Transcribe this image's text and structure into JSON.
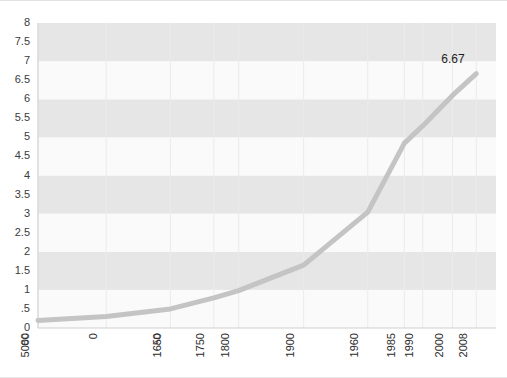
{
  "chart_data": {
    "type": "line",
    "title": "",
    "subtitle": "",
    "xlabel": "",
    "ylabel": "",
    "categories": [
      "5000 BC",
      "0 AD",
      "1650",
      "1750",
      "1800",
      "1900",
      "1960",
      "1985",
      "1990",
      "2000",
      "2008"
    ],
    "x_tick_labels": [
      {
        "main": "5000",
        "sub": "BC"
      },
      {
        "main": "0",
        "sub": ""
      },
      {
        "main": "1650",
        "sub": "AD"
      },
      {
        "main": "1750",
        "sub": ""
      },
      {
        "main": "1800",
        "sub": ""
      },
      {
        "main": "1900",
        "sub": ""
      },
      {
        "main": "1960",
        "sub": ""
      },
      {
        "main": "1985",
        "sub": ""
      },
      {
        "main": "1990",
        "sub": ""
      },
      {
        "main": "2000",
        "sub": ""
      },
      {
        "main": "2008",
        "sub": ""
      }
    ],
    "values": [
      0.2,
      0.3,
      0.5,
      0.79,
      0.98,
      1.65,
      3.04,
      4.85,
      5.3,
      6.1,
      6.67
    ],
    "ylim": [
      0,
      8
    ],
    "y_tick_labels": [
      "8",
      "7.5",
      "7",
      "6.5",
      "6",
      "5.5",
      "5",
      "4.5",
      "4",
      "3.5",
      "3",
      "2.5",
      "2",
      "1.5",
      "1",
      ".5",
      "0"
    ],
    "y_tick_values": [
      8,
      7.5,
      7,
      6.5,
      6,
      5.5,
      5,
      4.5,
      4,
      3.5,
      3,
      2.5,
      2,
      1.5,
      1,
      0.5,
      0
    ],
    "annotations": [
      {
        "text": "6.67",
        "x_category": "2008",
        "value": 6.67
      }
    ],
    "grid": {
      "vertical": true,
      "horizontal_bands": true
    },
    "legend": {
      "show": false,
      "position": "none"
    },
    "colors": {
      "line": "#c4c4c4",
      "band_dark": "#e6e6e6",
      "band_light": "#fafafa",
      "gridline": "#ebebeb",
      "axis": "#cfcfcf",
      "tick_text": "#2b2b2b",
      "background": "#ffffff"
    },
    "line_width": 5
  }
}
